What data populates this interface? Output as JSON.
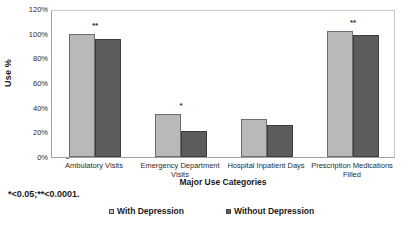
{
  "chart_data": {
    "type": "bar",
    "title": "",
    "xlabel": "Major Use Categories",
    "ylabel": "Use %",
    "ylim": [
      0,
      120
    ],
    "ytick_labels": [
      "0%",
      "20%",
      "40%",
      "60%",
      "80%",
      "100%",
      "120%"
    ],
    "ytick_values": [
      0,
      20,
      40,
      60,
      80,
      100,
      120
    ],
    "grid": false,
    "legend_position": "bottom",
    "categories": [
      "Ambulatory Visits",
      "Emergency Department Visits",
      "Hospital Inpatient Days",
      "Prescription Medications Filled"
    ],
    "series": [
      {
        "name": "With Depression",
        "color": "#b9b9b9",
        "values": [
          100,
          35,
          31,
          102
        ]
      },
      {
        "name": "Without Depression",
        "color": "#5c5c5c",
        "values": [
          96,
          21,
          26,
          99
        ]
      }
    ],
    "annotations": [
      {
        "category": "Ambulatory Visits",
        "marker": "**"
      },
      {
        "category": "Emergency Department Visits",
        "marker": "*"
      },
      {
        "category": "Prescription Medications Filled",
        "marker": "**"
      }
    ],
    "footnote": "*<0.05;**<0.0001."
  },
  "axes": {
    "y_title": "Use %",
    "x_title": "Major Use Categories",
    "y_ticks": [
      {
        "label": "120%",
        "value": 120
      },
      {
        "label": "100%",
        "value": 100
      },
      {
        "label": "80%",
        "value": 80
      },
      {
        "label": "60%",
        "value": 60
      },
      {
        "label": "40%",
        "value": 40
      },
      {
        "label": "20%",
        "value": 20
      },
      {
        "label": "0%",
        "value": 0
      }
    ]
  },
  "x_categories": [
    {
      "line1": "Ambulatory Visits",
      "line2": ""
    },
    {
      "line1": "Emergency Department",
      "line2": "Visits"
    },
    {
      "line1": "Hospital Inpatient Days",
      "line2": ""
    },
    {
      "line1": "Prescription Medications",
      "line2": "Filled"
    }
  ],
  "groups": [
    {
      "sig": "**",
      "light": 100,
      "dark": 96
    },
    {
      "sig": "*",
      "light": 35,
      "dark": 21
    },
    {
      "sig": "",
      "light": 31,
      "dark": 26
    },
    {
      "sig": "**",
      "light": 102,
      "dark": 99
    }
  ],
  "legend": {
    "items": [
      {
        "label": "With Depression",
        "swatch": "light"
      },
      {
        "label": "Without Depression",
        "swatch": "dark"
      }
    ]
  },
  "footnote": "*<0.05;**<0.0001.",
  "colors": {
    "with_depression": "#b9b9b9",
    "without_depression": "#5c5c5c",
    "axis": "#a0a0a0",
    "text": "#1a1a1a"
  }
}
